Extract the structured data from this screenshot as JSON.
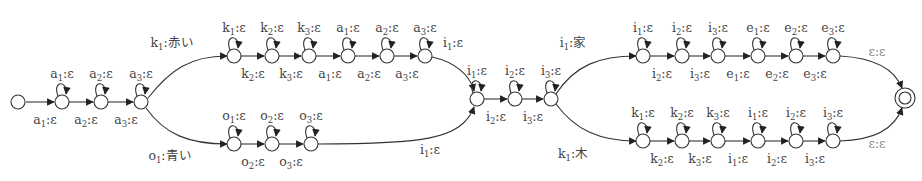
{
  "diagram": {
    "type": "weighted finite-state transducer",
    "node_radius": 7,
    "start_node": "s0",
    "final_node": "f",
    "nodes": [
      {
        "id": "s0",
        "x": 18,
        "y": 102,
        "kind": "start"
      },
      {
        "id": "a1",
        "x": 62,
        "y": 102
      },
      {
        "id": "a2",
        "x": 101,
        "y": 102
      },
      {
        "id": "a3",
        "x": 141,
        "y": 102
      },
      {
        "id": "t1",
        "x": 234,
        "y": 56
      },
      {
        "id": "t2",
        "x": 272,
        "y": 56
      },
      {
        "id": "t3",
        "x": 309,
        "y": 56
      },
      {
        "id": "t4",
        "x": 348,
        "y": 56
      },
      {
        "id": "t5",
        "x": 387,
        "y": 56
      },
      {
        "id": "t6",
        "x": 425,
        "y": 56
      },
      {
        "id": "b1",
        "x": 234,
        "y": 144
      },
      {
        "id": "b2",
        "x": 272,
        "y": 144
      },
      {
        "id": "b3",
        "x": 311,
        "y": 144
      },
      {
        "id": "m1",
        "x": 477,
        "y": 99
      },
      {
        "id": "m2",
        "x": 515,
        "y": 99
      },
      {
        "id": "m3",
        "x": 551,
        "y": 99
      },
      {
        "id": "u1",
        "x": 643,
        "y": 56
      },
      {
        "id": "u2",
        "x": 682,
        "y": 56
      },
      {
        "id": "u3",
        "x": 718,
        "y": 56
      },
      {
        "id": "u4",
        "x": 758,
        "y": 56
      },
      {
        "id": "u5",
        "x": 796,
        "y": 56
      },
      {
        "id": "u6",
        "x": 833,
        "y": 56
      },
      {
        "id": "l1",
        "x": 643,
        "y": 141
      },
      {
        "id": "l2",
        "x": 682,
        "y": 141
      },
      {
        "id": "l3",
        "x": 718,
        "y": 141
      },
      {
        "id": "l4",
        "x": 758,
        "y": 141
      },
      {
        "id": "l5",
        "x": 796,
        "y": 141
      },
      {
        "id": "l6",
        "x": 833,
        "y": 141
      },
      {
        "id": "f",
        "x": 905,
        "y": 98,
        "kind": "final"
      }
    ],
    "self_loops": [
      {
        "node": "a1",
        "in": "a",
        "sub": "1",
        "out": "ε"
      },
      {
        "node": "a2",
        "in": "a",
        "sub": "2",
        "out": "ε"
      },
      {
        "node": "a3",
        "in": "a",
        "sub": "3",
        "out": "ε"
      },
      {
        "node": "t1",
        "in": "k",
        "sub": "1",
        "out": "ε"
      },
      {
        "node": "t2",
        "in": "k",
        "sub": "2",
        "out": "ε"
      },
      {
        "node": "t3",
        "in": "k",
        "sub": "3",
        "out": "ε"
      },
      {
        "node": "t4",
        "in": "a",
        "sub": "1",
        "out": "ε"
      },
      {
        "node": "t5",
        "in": "a",
        "sub": "2",
        "out": "ε"
      },
      {
        "node": "t6",
        "in": "a",
        "sub": "3",
        "out": "ε"
      },
      {
        "node": "b1",
        "in": "o",
        "sub": "1",
        "out": "ε"
      },
      {
        "node": "b2",
        "in": "o",
        "sub": "2",
        "out": "ε"
      },
      {
        "node": "b3",
        "in": "o",
        "sub": "3",
        "out": "ε"
      },
      {
        "node": "m1",
        "in": "i",
        "sub": "1",
        "out": "ε"
      },
      {
        "node": "m2",
        "in": "i",
        "sub": "2",
        "out": "ε"
      },
      {
        "node": "m3",
        "in": "i",
        "sub": "3",
        "out": "ε"
      },
      {
        "node": "u1",
        "in": "i",
        "sub": "1",
        "out": "ε"
      },
      {
        "node": "u2",
        "in": "i",
        "sub": "2",
        "out": "ε"
      },
      {
        "node": "u3",
        "in": "i",
        "sub": "3",
        "out": "ε"
      },
      {
        "node": "u4",
        "in": "e",
        "sub": "1",
        "out": "ε"
      },
      {
        "node": "u5",
        "in": "e",
        "sub": "2",
        "out": "ε"
      },
      {
        "node": "u6",
        "in": "e",
        "sub": "3",
        "out": "ε"
      },
      {
        "node": "l1",
        "in": "k",
        "sub": "1",
        "out": "ε"
      },
      {
        "node": "l2",
        "in": "k",
        "sub": "2",
        "out": "ε"
      },
      {
        "node": "l3",
        "in": "k",
        "sub": "3",
        "out": "ε"
      },
      {
        "node": "l4",
        "in": "i",
        "sub": "1",
        "out": "ε"
      },
      {
        "node": "l5",
        "in": "i",
        "sub": "2",
        "out": "ε"
      },
      {
        "node": "l6",
        "in": "i",
        "sub": "3",
        "out": "ε"
      }
    ],
    "edges": [
      {
        "from": "s0",
        "to": "a1",
        "in": "a",
        "sub": "1",
        "out": "ε",
        "lx": 45,
        "ly": 124
      },
      {
        "from": "a1",
        "to": "a2",
        "in": "a",
        "sub": "2",
        "out": "ε",
        "lx": 86,
        "ly": 124
      },
      {
        "from": "a2",
        "to": "a3",
        "in": "a",
        "sub": "3",
        "out": "ε",
        "lx": 126,
        "ly": 124
      },
      {
        "from": "a3",
        "to": "t1",
        "curve": "M148,98 C170,70 190,56 227,56",
        "in": "k",
        "sub": "1",
        "out": ":赤い",
        "lx": 172,
        "ly": 47,
        "jp": true
      },
      {
        "from": "a3",
        "to": "b1",
        "curve": "M146,108 C165,135 190,144 227,144",
        "in": "o",
        "sub": "1",
        "out": ":青い",
        "lx": 170,
        "ly": 160,
        "jp": true
      },
      {
        "from": "t1",
        "to": "t2",
        "in": "k",
        "sub": "2",
        "out": "ε",
        "lx": 253,
        "ly": 78
      },
      {
        "from": "t2",
        "to": "t3",
        "in": "k",
        "sub": "3",
        "out": "ε",
        "lx": 291,
        "ly": 78
      },
      {
        "from": "t3",
        "to": "t4",
        "in": "a",
        "sub": "1",
        "out": "ε",
        "lx": 330,
        "ly": 78
      },
      {
        "from": "t4",
        "to": "t5",
        "in": "a",
        "sub": "2",
        "out": "ε",
        "lx": 369,
        "ly": 78
      },
      {
        "from": "t5",
        "to": "t6",
        "in": "a",
        "sub": "3",
        "out": "ε",
        "lx": 407,
        "ly": 78
      },
      {
        "from": "t6",
        "to": "m1",
        "curve": "M432,57 C455,62 470,75 474,91",
        "in": "i",
        "sub": "1",
        "out": "ε",
        "lx": 453,
        "ly": 47
      },
      {
        "from": "b1",
        "to": "b2",
        "in": "o",
        "sub": "2",
        "out": "ε",
        "lx": 253,
        "ly": 166
      },
      {
        "from": "b2",
        "to": "b3",
        "in": "o",
        "sub": "3",
        "out": "ε",
        "lx": 291,
        "ly": 166
      },
      {
        "from": "b3",
        "to": "m1",
        "curve": "M318,144 C420,144 462,140 474,107",
        "in": "i",
        "sub": "1",
        "out": "ε",
        "lx": 430,
        "ly": 154
      },
      {
        "from": "m1",
        "to": "m2",
        "in": "i",
        "sub": "2",
        "out": "ε",
        "lx": 496,
        "ly": 121
      },
      {
        "from": "m2",
        "to": "m3",
        "in": "i",
        "sub": "3",
        "out": "ε",
        "lx": 533,
        "ly": 121
      },
      {
        "from": "m3",
        "to": "u1",
        "curve": "M556,94 C575,65 600,56 636,56",
        "in": "i",
        "sub": "1",
        "out": ":家",
        "lx": 573,
        "ly": 47,
        "jp": true
      },
      {
        "from": "m3",
        "to": "l1",
        "curve": "M556,104 C575,130 600,141 636,141",
        "in": "k",
        "sub": "1",
        "out": ":木",
        "lx": 573,
        "ly": 158,
        "jp": true
      },
      {
        "from": "u1",
        "to": "u2",
        "in": "i",
        "sub": "2",
        "out": "ε",
        "lx": 662,
        "ly": 78
      },
      {
        "from": "u2",
        "to": "u3",
        "in": "i",
        "sub": "3",
        "out": "ε",
        "lx": 700,
        "ly": 78
      },
      {
        "from": "u3",
        "to": "u4",
        "in": "e",
        "sub": "1",
        "out": "ε",
        "lx": 738,
        "ly": 78
      },
      {
        "from": "u4",
        "to": "u5",
        "in": "e",
        "sub": "2",
        "out": "ε",
        "lx": 777,
        "ly": 78
      },
      {
        "from": "u5",
        "to": "u6",
        "in": "e",
        "sub": "3",
        "out": "ε",
        "lx": 815,
        "ly": 78
      },
      {
        "from": "u6",
        "to": "f",
        "curve": "M840,56 C875,58 895,70 902,88",
        "in": "ε",
        "sub": "",
        "out": "ε",
        "lx": 877,
        "ly": 56,
        "gray": true
      },
      {
        "from": "l1",
        "to": "l2",
        "in": "k",
        "sub": "2",
        "out": "ε",
        "lx": 662,
        "ly": 163
      },
      {
        "from": "l2",
        "to": "l3",
        "in": "k",
        "sub": "3",
        "out": "ε",
        "lx": 700,
        "ly": 163
      },
      {
        "from": "l3",
        "to": "l4",
        "in": "i",
        "sub": "1",
        "out": "ε",
        "lx": 738,
        "ly": 163
      },
      {
        "from": "l4",
        "to": "l5",
        "in": "i",
        "sub": "2",
        "out": "ε",
        "lx": 777,
        "ly": 163
      },
      {
        "from": "l5",
        "to": "l6",
        "in": "i",
        "sub": "3",
        "out": "ε",
        "lx": 815,
        "ly": 163
      },
      {
        "from": "l6",
        "to": "f",
        "curve": "M840,141 C875,140 895,128 902,108",
        "in": "ε",
        "sub": "",
        "out": "ε",
        "lx": 877,
        "ly": 148,
        "gray": true
      }
    ]
  }
}
